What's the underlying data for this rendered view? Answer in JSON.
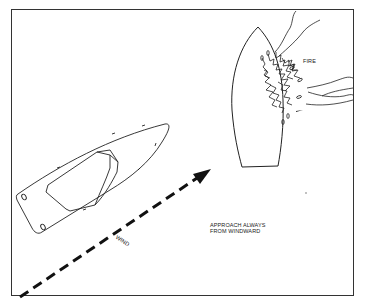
{
  "diagram": {
    "labels": {
      "fire": "FIRE",
      "approach_line1": "APPROACH ALWAYS",
      "approach_line2": "FROM WINDWARD",
      "wind": "WIND"
    },
    "elements": {
      "rescue_boat": "approaching-boat",
      "burning_boat": "boat-on-fire",
      "wind_arrow": "dashed-arrow-direction-northeast"
    },
    "colors": {
      "line": "#222222",
      "background": "#ffffff",
      "frame": "#333333"
    }
  }
}
